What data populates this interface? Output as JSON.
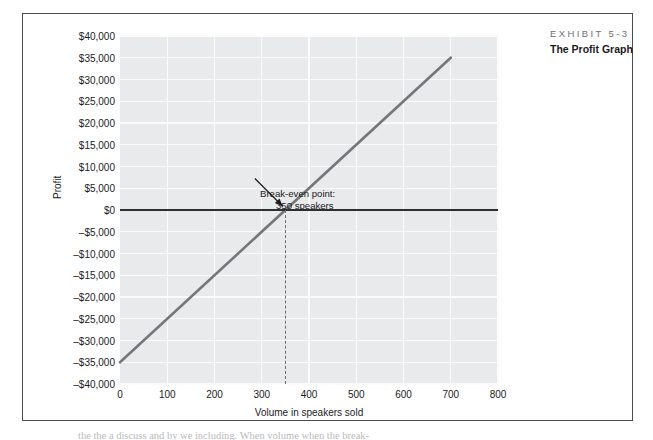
{
  "exhibit": {
    "number": "EXHIBIT 5-3",
    "title": "The Profit Graph"
  },
  "annotation": {
    "line1": "Break-even point:",
    "line2": "350 speakers"
  },
  "body_text_clipped": "the the a discuss and by we including. When volume when the break-",
  "colors": {
    "panel": "#e9eaec",
    "gridline": "#fbfbfc",
    "profit_line": "#75777a",
    "zero_line": "#2f2f31",
    "dashed_line": "#6d6f72",
    "frame": "#4c4c4e",
    "exhibit_number": "#6f7173",
    "text": "#231f20"
  },
  "chart_data": {
    "type": "line",
    "title": "The Profit Graph",
    "xlabel": "Volume in speakers sold",
    "ylabel": "Profit",
    "xlim": [
      0,
      800
    ],
    "ylim": [
      -40000,
      40000
    ],
    "grid": true,
    "legend": "none",
    "xticks": [
      0,
      100,
      200,
      300,
      400,
      500,
      600,
      700,
      800
    ],
    "xtick_labels": [
      "0",
      "100",
      "200",
      "300",
      "400",
      "500",
      "600",
      "700",
      "800"
    ],
    "yticks": [
      40000,
      35000,
      30000,
      25000,
      20000,
      15000,
      10000,
      5000,
      0,
      -5000,
      -10000,
      -15000,
      -20000,
      -25000,
      -30000,
      -35000,
      -40000
    ],
    "ytick_labels": [
      "$40,000",
      "$35,000",
      "$30,000",
      "$25,000",
      "$20,000",
      "$15,000",
      "$10,000",
      "$5,000",
      "$0",
      "-$5,000",
      "-$10,000",
      "-$15,000",
      "-$20,000",
      "-$25,000",
      "-$30,000",
      "-$35,000",
      "-$40,000"
    ],
    "series": [
      {
        "name": "Profit",
        "x": [
          0,
          700
        ],
        "values": [
          -35000,
          35000
        ],
        "color": "#75777a"
      }
    ],
    "reference_lines": [
      {
        "name": "zero-profit-line",
        "orientation": "horizontal",
        "value": 0,
        "color": "#2f2f31"
      },
      {
        "name": "break-even-drop-line",
        "orientation": "vertical",
        "value": 350,
        "from": -40000,
        "to": 0,
        "style": "dashed",
        "color": "#6d6f72"
      }
    ],
    "annotations": [
      {
        "name": "break-even-point",
        "text": "Break-even point: 350 speakers",
        "x": 350,
        "y": 0
      }
    ]
  }
}
